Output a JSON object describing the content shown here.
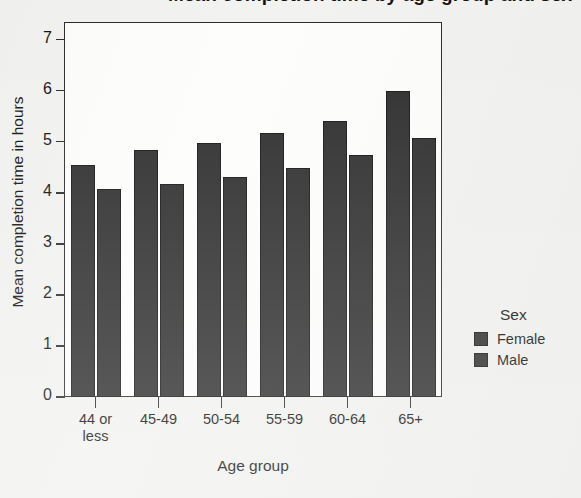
{
  "chart_data": {
    "type": "bar",
    "title": "",
    "xlabel": "Age group",
    "ylabel": "Mean completion time in hours",
    "categories": [
      "44 or\nless",
      "45-49",
      "50-54",
      "55-59",
      "60-64",
      "65+"
    ],
    "series": [
      {
        "name": "Female",
        "values": [
          4.55,
          4.84,
          4.97,
          5.18,
          5.4,
          6.0
        ],
        "color": "#2e2e2e"
      },
      {
        "name": "Male",
        "values": [
          4.08,
          4.18,
          4.31,
          4.48,
          4.75,
          5.07
        ],
        "color": "#2e2e2e"
      }
    ],
    "ylim": [
      0,
      7.35
    ],
    "yticks": [
      0,
      1,
      2,
      3,
      4,
      5,
      6,
      7
    ],
    "ytick_labels": [
      "0",
      "1",
      "2",
      "3",
      "4",
      "5",
      "6",
      "7"
    ],
    "grid": false,
    "legend_position": "right",
    "legend_title": "Sex"
  },
  "figure": {
    "cropped_title_fragment": "Mean completion time by age group and sex",
    "axis": {
      "y_title": "Mean completion time in hours",
      "x_title": "Age group"
    },
    "legend": {
      "title": "Sex",
      "entries": [
        {
          "label": "Female"
        },
        {
          "label": "Male"
        }
      ]
    }
  }
}
